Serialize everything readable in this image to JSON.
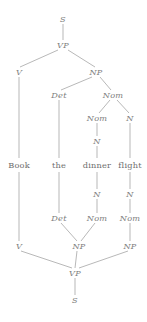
{
  "diagram": {
    "type": "constituency-tree",
    "sentence": "Book the dinner flight",
    "line_color": "#9a9a9a",
    "text_color": "#7d7d7d",
    "background": "#ffffff",
    "nodes": [
      {
        "id": "n0",
        "label": "S",
        "kind": "cat",
        "x": 63,
        "y": 19
      },
      {
        "id": "n1",
        "label": "VP",
        "kind": "cat",
        "x": 63,
        "y": 45
      },
      {
        "id": "n2",
        "label": "V",
        "kind": "cat",
        "x": 19,
        "y": 72
      },
      {
        "id": "n3",
        "label": "NP",
        "kind": "cat",
        "x": 96,
        "y": 72
      },
      {
        "id": "n4",
        "label": "Det",
        "kind": "cat",
        "x": 59,
        "y": 95
      },
      {
        "id": "n5",
        "label": "Nom",
        "kind": "cat",
        "x": 113,
        "y": 95
      },
      {
        "id": "n6",
        "label": "Nom",
        "kind": "cat",
        "x": 97,
        "y": 118
      },
      {
        "id": "n7",
        "label": "N",
        "kind": "cat",
        "x": 130,
        "y": 118
      },
      {
        "id": "n8",
        "label": "N",
        "kind": "cat",
        "x": 97,
        "y": 141
      },
      {
        "id": "w0",
        "label": "Book",
        "kind": "word",
        "x": 19,
        "y": 165
      },
      {
        "id": "w1",
        "label": "the",
        "kind": "word",
        "x": 59,
        "y": 165
      },
      {
        "id": "w2",
        "label": "dinner",
        "kind": "word",
        "x": 97,
        "y": 165
      },
      {
        "id": "w3",
        "label": "flight",
        "kind": "word",
        "x": 130,
        "y": 165
      },
      {
        "id": "m0",
        "label": "N",
        "kind": "cat",
        "x": 97,
        "y": 194
      },
      {
        "id": "m1",
        "label": "N",
        "kind": "cat",
        "x": 130,
        "y": 194
      },
      {
        "id": "m2",
        "label": "Det",
        "kind": "cat",
        "x": 59,
        "y": 218
      },
      {
        "id": "m3",
        "label": "Nom",
        "kind": "cat",
        "x": 97,
        "y": 218
      },
      {
        "id": "m4",
        "label": "Nom",
        "kind": "cat",
        "x": 130,
        "y": 218
      },
      {
        "id": "m5",
        "label": "V",
        "kind": "cat",
        "x": 19,
        "y": 246
      },
      {
        "id": "m6",
        "label": "NP",
        "kind": "cat",
        "x": 79,
        "y": 246
      },
      {
        "id": "m7",
        "label": "NP",
        "kind": "cat",
        "x": 130,
        "y": 246
      },
      {
        "id": "m8",
        "label": "VP",
        "kind": "cat",
        "x": 75,
        "y": 273
      },
      {
        "id": "m9",
        "label": "S",
        "kind": "cat",
        "x": 75,
        "y": 300
      }
    ],
    "edges": [
      {
        "from": "n0",
        "to": "n1",
        "x1": 63,
        "y1": 24,
        "x2": 63,
        "y2": 40
      },
      {
        "from": "n1",
        "to": "n2",
        "x1": 58,
        "y1": 50,
        "x2": 20,
        "y2": 67
      },
      {
        "from": "n1",
        "to": "n3",
        "x1": 68,
        "y1": 50,
        "x2": 95,
        "y2": 67
      },
      {
        "from": "n3",
        "to": "n4",
        "x1": 92,
        "y1": 77,
        "x2": 61,
        "y2": 90
      },
      {
        "from": "n3",
        "to": "n5",
        "x1": 100,
        "y1": 77,
        "x2": 111,
        "y2": 90
      },
      {
        "from": "n5",
        "to": "n6",
        "x1": 110,
        "y1": 100,
        "x2": 99,
        "y2": 113
      },
      {
        "from": "n5",
        "to": "n7",
        "x1": 117,
        "y1": 100,
        "x2": 129,
        "y2": 113
      },
      {
        "from": "n6",
        "to": "n8",
        "x1": 97,
        "y1": 123,
        "x2": 97,
        "y2": 136
      },
      {
        "from": "n2",
        "to": "w0",
        "x1": 19,
        "y1": 77,
        "x2": 19,
        "y2": 158
      },
      {
        "from": "n4",
        "to": "w1",
        "x1": 59,
        "y1": 100,
        "x2": 59,
        "y2": 158
      },
      {
        "from": "n8",
        "to": "w2",
        "x1": 97,
        "y1": 146,
        "x2": 97,
        "y2": 158
      },
      {
        "from": "n7",
        "to": "w3",
        "x1": 130,
        "y1": 123,
        "x2": 130,
        "y2": 158
      },
      {
        "from": "w2",
        "to": "m0",
        "x1": 97,
        "y1": 172,
        "x2": 97,
        "y2": 189
      },
      {
        "from": "w3",
        "to": "m1",
        "x1": 130,
        "y1": 172,
        "x2": 130,
        "y2": 189
      },
      {
        "from": "m0",
        "to": "m3",
        "x1": 97,
        "y1": 199,
        "x2": 97,
        "y2": 213
      },
      {
        "from": "m1",
        "to": "m4",
        "x1": 130,
        "y1": 199,
        "x2": 130,
        "y2": 213
      },
      {
        "from": "w1",
        "to": "m2",
        "x1": 59,
        "y1": 172,
        "x2": 59,
        "y2": 213
      },
      {
        "from": "m2",
        "to": "m6",
        "x1": 61,
        "y1": 223,
        "x2": 77,
        "y2": 241
      },
      {
        "from": "m3",
        "to": "m6",
        "x1": 95,
        "y1": 223,
        "x2": 81,
        "y2": 241
      },
      {
        "from": "m4",
        "to": "m7",
        "x1": 130,
        "y1": 223,
        "x2": 130,
        "y2": 241
      },
      {
        "from": "w0",
        "to": "m5",
        "x1": 19,
        "y1": 172,
        "x2": 19,
        "y2": 241
      },
      {
        "from": "m5",
        "to": "m8",
        "x1": 21,
        "y1": 251,
        "x2": 72,
        "y2": 268
      },
      {
        "from": "m6",
        "to": "m8",
        "x1": 77,
        "y1": 251,
        "x2": 75,
        "y2": 268
      },
      {
        "from": "m7",
        "to": "m8",
        "x1": 128,
        "y1": 251,
        "x2": 79,
        "y2": 268
      },
      {
        "from": "m8",
        "to": "m9",
        "x1": 75,
        "y1": 278,
        "x2": 75,
        "y2": 295
      }
    ]
  }
}
